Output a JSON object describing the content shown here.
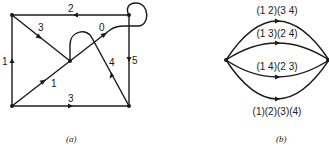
{
  "figure_a": {
    "caption": "(a)",
    "nodes": [
      {
        "id": "top-left",
        "x": 12,
        "y": 15
      },
      {
        "id": "top-right",
        "x": 129,
        "y": 15
      },
      {
        "id": "center",
        "x": 70,
        "y": 61
      },
      {
        "id": "bottom-left",
        "x": 12,
        "y": 106
      },
      {
        "id": "bottom-right",
        "x": 129,
        "y": 106
      }
    ],
    "edge_labels": {
      "top": "2",
      "diag_top": "3",
      "loop": "0",
      "left": "1",
      "right": "5",
      "diag_bottom": "1",
      "bottom": "3",
      "diag_right": "4"
    }
  },
  "figure_b": {
    "caption": "(b)",
    "edge_labels": [
      "(1 2)(3 4)",
      "(1 3)(2 4)",
      "(1 4)(2 3)",
      "(1)(2)(3)(4)"
    ]
  }
}
